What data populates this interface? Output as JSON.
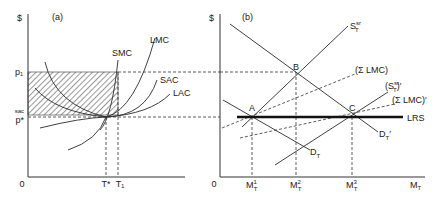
{
  "panel_a": {
    "label": "(a)",
    "y_axis_label": "$",
    "origin_label": "0",
    "price_labels": {
      "p1": "p₁",
      "sac": "sac",
      "p_star": "p*"
    },
    "quantity_labels": {
      "t_star": "T*",
      "t1": "T₁"
    },
    "curves": {
      "smc": "SMC",
      "lmc": "LMC",
      "sac": "SAC",
      "lac": "LAC"
    }
  },
  "panel_b": {
    "label": "(b)",
    "y_axis_label": "$",
    "origin_label": "0",
    "points": {
      "a": "A",
      "b": "B",
      "c": "C"
    },
    "curves": {
      "st": "S",
      "st_sup": "sr",
      "st_sub": "T",
      "sum_lmc": "(Σ LMC)",
      "st_prime": "(S",
      "st_prime_sup": "sr",
      "st_prime_sub": "T",
      "st_prime_tail": ")′",
      "sum_lmc_prime": "(Σ LMC)′",
      "lrs": "LRS",
      "dt": "D",
      "dt_sub": "T",
      "dt_prime": "D",
      "dt_prime_sub": "T",
      "dt_prime_tail": "′"
    },
    "quantity_labels": {
      "m": "M",
      "m1_sup": "1",
      "m2_sup": "2",
      "m3_sup": "3",
      "sub": "T",
      "axis": "M",
      "axis_sub": "T"
    }
  }
}
